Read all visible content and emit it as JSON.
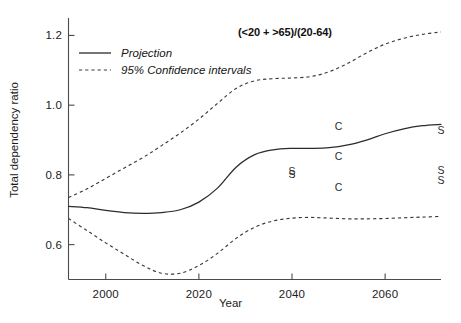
{
  "chart_data": {
    "type": "line",
    "title": "",
    "annotation": "(<20 + >65)/(20-64)",
    "xlabel": "Year",
    "ylabel": "Total dependency ratio",
    "xlim": [
      1992,
      2072
    ],
    "ylim": [
      0.5,
      1.25
    ],
    "xticks": [
      2000,
      2020,
      2040,
      2060
    ],
    "xticklabels": [
      "2000",
      "2020",
      "2040",
      "2060"
    ],
    "yticks": [
      0.6,
      0.8,
      1.0,
      1.2
    ],
    "yticklabels": [
      "0.6",
      "0.8",
      "1.0",
      "1.2"
    ],
    "grid": false,
    "legend_position": "upper-left",
    "legend": [
      {
        "label": "Projection",
        "style": "solid"
      },
      {
        "label": "95% Confidence intervals",
        "style": "dashed"
      }
    ],
    "series": [
      {
        "name": "Projection",
        "style": "solid",
        "x": [
          1992,
          1996,
          2000,
          2004,
          2008,
          2012,
          2016,
          2020,
          2024,
          2028,
          2032,
          2036,
          2040,
          2044,
          2048,
          2052,
          2056,
          2060,
          2064,
          2068,
          2072
        ],
        "values": [
          0.71,
          0.706,
          0.698,
          0.692,
          0.69,
          0.692,
          0.7,
          0.722,
          0.762,
          0.822,
          0.858,
          0.872,
          0.876,
          0.876,
          0.878,
          0.886,
          0.9,
          0.918,
          0.932,
          0.941,
          0.945
        ]
      },
      {
        "name": "95% CI upper",
        "style": "dashed",
        "x": [
          1992,
          1996,
          2000,
          2004,
          2008,
          2012,
          2016,
          2020,
          2024,
          2028,
          2032,
          2036,
          2040,
          2044,
          2048,
          2052,
          2056,
          2060,
          2064,
          2068,
          2072
        ],
        "values": [
          0.735,
          0.76,
          0.79,
          0.82,
          0.85,
          0.884,
          0.92,
          0.96,
          1.005,
          1.048,
          1.07,
          1.076,
          1.078,
          1.082,
          1.096,
          1.12,
          1.15,
          1.175,
          1.192,
          1.203,
          1.21
        ]
      },
      {
        "name": "95% CI lower",
        "style": "dashed",
        "x": [
          1992,
          1996,
          2000,
          2004,
          2008,
          2012,
          2016,
          2020,
          2024,
          2028,
          2032,
          2036,
          2040,
          2044,
          2048,
          2052,
          2056,
          2060,
          2064,
          2068,
          2072
        ],
        "values": [
          0.675,
          0.64,
          0.605,
          0.572,
          0.54,
          0.518,
          0.518,
          0.54,
          0.575,
          0.618,
          0.65,
          0.668,
          0.676,
          0.678,
          0.676,
          0.674,
          0.674,
          0.675,
          0.677,
          0.679,
          0.681
        ]
      }
    ],
    "point_markers": [
      {
        "label": "S",
        "x": 2040,
        "y": 0.812
      },
      {
        "label": "S",
        "x": 2040,
        "y": 0.802
      },
      {
        "label": "C",
        "x": 2050,
        "y": 0.94
      },
      {
        "label": "C",
        "x": 2050,
        "y": 0.855
      },
      {
        "label": "C",
        "x": 2050,
        "y": 0.765
      },
      {
        "label": "S",
        "x": 2072,
        "y": 0.928
      },
      {
        "label": "S",
        "x": 2072,
        "y": 0.815
      },
      {
        "label": "S",
        "x": 2072,
        "y": 0.785
      }
    ]
  }
}
